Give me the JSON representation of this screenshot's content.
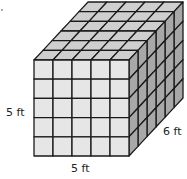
{
  "figure": {
    "type": "unit-cube-prism",
    "cubes": {
      "width": 5,
      "height": 5,
      "depth": 6
    },
    "labels": {
      "height": "5 ft",
      "width": "5 ft",
      "depth": "6 ft"
    },
    "colors": {
      "front": "#e6e6e6",
      "top": "#cfcfcf",
      "side": "#a8a8a8",
      "stroke": "#1a1a1a"
    }
  }
}
